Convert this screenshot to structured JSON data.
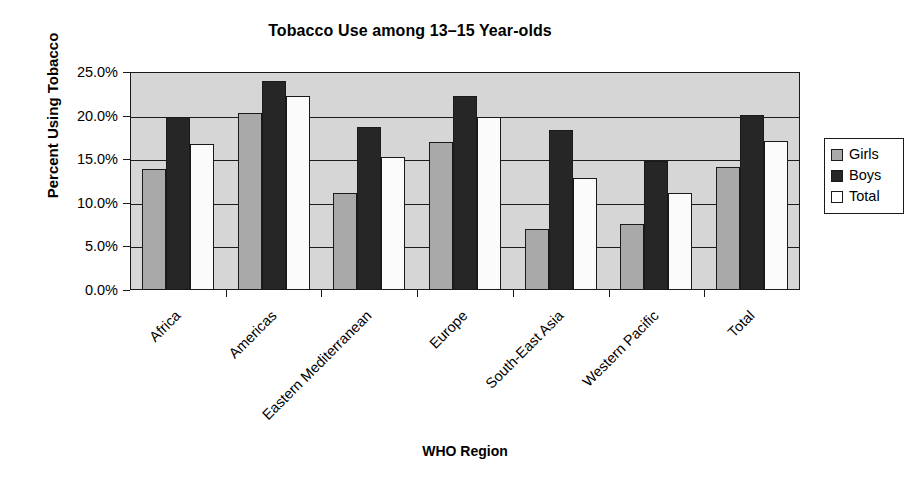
{
  "chart_data": {
    "type": "bar",
    "title": "Tobacco Use among 13–15 Year-olds",
    "xlabel": "WHO Region",
    "ylabel": "Percent Using Tobacco",
    "ylim": [
      0,
      25
    ],
    "ytick_labels": [
      "0.0%",
      "5.0%",
      "10.0%",
      "15.0%",
      "20.0%",
      "25.0%"
    ],
    "ytick_values": [
      0,
      5,
      10,
      15,
      20,
      25
    ],
    "grid": true,
    "legend_position": "right",
    "categories": [
      "Africa",
      "Americas",
      "Eastern Mediterranean",
      "Europe",
      "South-East Asia",
      "Western Pacific",
      "Total"
    ],
    "series": [
      {
        "name": "Girls",
        "color": "#a9a9a9",
        "values": [
          13.9,
          20.3,
          11.1,
          17.0,
          7.0,
          7.6,
          14.1
        ]
      },
      {
        "name": "Boys",
        "color": "#262626",
        "values": [
          19.8,
          24.0,
          18.7,
          22.2,
          18.4,
          14.8,
          20.1
        ]
      },
      {
        "name": "Total",
        "color": "#ffffff",
        "values": [
          16.8,
          22.2,
          15.3,
          19.8,
          12.9,
          11.1,
          17.1
        ]
      }
    ]
  },
  "legend": {
    "items": [
      {
        "label": "Girls",
        "swatch": "girls"
      },
      {
        "label": "Boys",
        "swatch": "boys"
      },
      {
        "label": "Total",
        "swatch": "total"
      }
    ]
  },
  "colors": {
    "plot_background": "#d6d6d6",
    "axis": "#1a1a1a",
    "page_background": "#ffffff"
  }
}
